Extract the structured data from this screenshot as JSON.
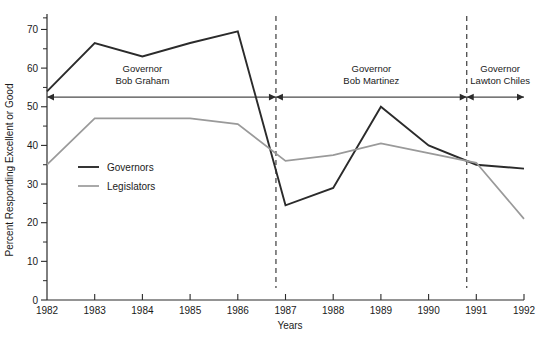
{
  "chart_data": {
    "type": "line",
    "title": "",
    "xlabel": "Years",
    "ylabel": "Percent Responding Excellent or Good",
    "x": [
      1982,
      1983,
      1984,
      1985,
      1986,
      1987,
      1988,
      1989,
      1990,
      1991,
      1992
    ],
    "xtick_labels": [
      "1982",
      "1983",
      "1984",
      "1985",
      "1986",
      "1987",
      "1988",
      "1989",
      "1990",
      "1991",
      "1992"
    ],
    "ytick_labels": [
      "0",
      "10",
      "20",
      "30",
      "40",
      "50",
      "60",
      "70"
    ],
    "ytick_values": [
      0,
      10,
      20,
      30,
      40,
      50,
      60,
      70
    ],
    "yminor_step": 5,
    "ylim": [
      0,
      74
    ],
    "xlim": [
      1982,
      1992
    ],
    "grid": false,
    "legend_position": "inside-left",
    "series": [
      {
        "name": "Governors",
        "color": "#2b2b2b",
        "width": 1.9,
        "values": [
          54,
          66.5,
          63,
          66.5,
          69.5,
          24.5,
          29,
          50,
          40,
          35,
          34
        ]
      },
      {
        "name": "Legislators",
        "color": "#9a9a9a",
        "width": 1.7,
        "values": [
          35,
          47,
          47,
          47,
          45.5,
          36,
          37.5,
          40.5,
          38,
          35.5,
          21
        ]
      }
    ],
    "annotations": [
      {
        "id": "term-bob-graham",
        "lines": [
          "Governor",
          "Bob Graham"
        ],
        "start_year": 1982,
        "end_year": 1986.8,
        "label_x": 1984.0,
        "label_y": 59
      },
      {
        "id": "term-bob-martinez",
        "lines": [
          "Governor",
          "Bob Martinez"
        ],
        "start_year": 1986.8,
        "end_year": 1990.8,
        "label_x": 1988.8,
        "label_y": 59
      },
      {
        "id": "term-lawton-chiles",
        "lines": [
          "Governor",
          "Lawton Chiles"
        ],
        "start_year": 1990.8,
        "end_year": 1992,
        "label_x": 1991.5,
        "label_y": 59
      }
    ],
    "dividers": [
      1986.8,
      1990.8
    ]
  },
  "axes": {
    "x_title": "Years",
    "y_title": "Percent Responding Excellent or Good"
  },
  "legend": {
    "items": [
      {
        "label": "Governors"
      },
      {
        "label": "Legislators"
      }
    ]
  }
}
